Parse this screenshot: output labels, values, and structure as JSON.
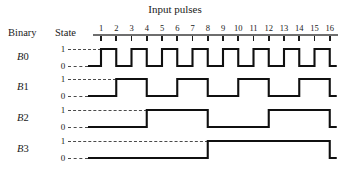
{
  "figure": {
    "title": "Input pulses",
    "headers": {
      "binary": "Binary",
      "state": "State"
    },
    "state_high": "1",
    "state_low": "0"
  },
  "chart_data": {
    "type": "line",
    "title": "Input pulses",
    "xlabel": "Input pulses",
    "ylabel": "State",
    "grid": false,
    "legend": "none",
    "xlim": [
      0,
      16
    ],
    "ylim": [
      0,
      1
    ],
    "x": [
      1,
      2,
      3,
      4,
      5,
      6,
      7,
      8,
      9,
      10,
      11,
      12,
      13,
      14,
      15,
      16
    ],
    "xticklabels": [
      "1",
      "2",
      "3",
      "4",
      "5",
      "6",
      "7",
      "8",
      "9",
      "10",
      "11",
      "12",
      "13",
      "14",
      "15",
      "16"
    ],
    "yticklabels": [
      "1",
      "0"
    ],
    "series": [
      {
        "name": "B0",
        "label": "B0",
        "period_pulses": 2,
        "rises_at": [
          1,
          3,
          5,
          7,
          9,
          11,
          13,
          15
        ],
        "falls_at": [
          2,
          4,
          6,
          8,
          10,
          12,
          14,
          16
        ],
        "values": [
          1,
          0,
          1,
          0,
          1,
          0,
          1,
          0,
          1,
          0,
          1,
          0,
          1,
          0,
          1,
          0
        ]
      },
      {
        "name": "B1",
        "label": "B1",
        "period_pulses": 4,
        "rises_at": [
          2,
          6,
          10,
          14
        ],
        "falls_at": [
          4,
          8,
          12,
          16
        ],
        "values": [
          0,
          1,
          1,
          0,
          0,
          1,
          1,
          0,
          0,
          1,
          1,
          0,
          0,
          1,
          1,
          0
        ]
      },
      {
        "name": "B2",
        "label": "B2",
        "period_pulses": 8,
        "rises_at": [
          4,
          12
        ],
        "falls_at": [
          8,
          16
        ],
        "values": [
          0,
          0,
          0,
          1,
          1,
          1,
          1,
          0,
          0,
          0,
          0,
          1,
          1,
          1,
          1,
          0
        ]
      },
      {
        "name": "B3",
        "label": "B3",
        "period_pulses": 16,
        "rises_at": [
          8
        ],
        "falls_at": [
          16
        ],
        "values": [
          0,
          0,
          0,
          0,
          0,
          0,
          0,
          1,
          1,
          1,
          1,
          1,
          1,
          1,
          1,
          0
        ]
      }
    ]
  },
  "colors": {
    "waveform": "#101010",
    "axis": "#6e6e6e",
    "tick": "#1c1c1c",
    "dashed_guide": "#4a4a4a",
    "text": "#1a1a1a",
    "background": "#ffffff"
  }
}
